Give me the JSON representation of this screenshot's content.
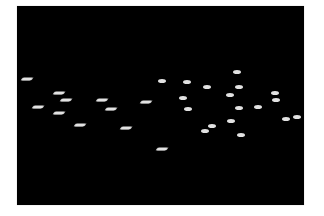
{
  "image": {
    "background_color": "#ffffff",
    "frame_color": "#000000",
    "particle_color": "#e2e2e2",
    "description": "Bright elongated particles on a black background",
    "frame": {
      "x": 17,
      "y": 6,
      "width": 287,
      "height": 199
    }
  },
  "particles": [
    {
      "x": 27,
      "y": 79,
      "shape": "streak"
    },
    {
      "x": 59,
      "y": 93,
      "shape": "streak"
    },
    {
      "x": 66,
      "y": 100,
      "shape": "streak"
    },
    {
      "x": 38,
      "y": 107,
      "shape": "streak"
    },
    {
      "x": 59,
      "y": 113,
      "shape": "streak"
    },
    {
      "x": 80,
      "y": 125,
      "shape": "streak"
    },
    {
      "x": 102,
      "y": 100,
      "shape": "streak"
    },
    {
      "x": 111,
      "y": 109,
      "shape": "streak"
    },
    {
      "x": 126,
      "y": 128,
      "shape": "streak"
    },
    {
      "x": 146,
      "y": 102,
      "shape": "streak"
    },
    {
      "x": 162,
      "y": 149,
      "shape": "streak"
    },
    {
      "x": 162,
      "y": 81,
      "shape": "dot"
    },
    {
      "x": 187,
      "y": 82,
      "shape": "dot"
    },
    {
      "x": 183,
      "y": 98,
      "shape": "dot"
    },
    {
      "x": 188,
      "y": 109,
      "shape": "dot"
    },
    {
      "x": 207,
      "y": 87,
      "shape": "dot"
    },
    {
      "x": 212,
      "y": 126,
      "shape": "dot"
    },
    {
      "x": 205,
      "y": 131,
      "shape": "dot"
    },
    {
      "x": 237,
      "y": 72,
      "shape": "dot"
    },
    {
      "x": 239,
      "y": 87,
      "shape": "dot"
    },
    {
      "x": 230,
      "y": 95,
      "shape": "dot"
    },
    {
      "x": 239,
      "y": 108,
      "shape": "dot"
    },
    {
      "x": 231,
      "y": 121,
      "shape": "dot"
    },
    {
      "x": 241,
      "y": 135,
      "shape": "dot"
    },
    {
      "x": 258,
      "y": 107,
      "shape": "dot"
    },
    {
      "x": 275,
      "y": 93,
      "shape": "dot"
    },
    {
      "x": 276,
      "y": 100,
      "shape": "dot"
    },
    {
      "x": 286,
      "y": 119,
      "shape": "dot"
    },
    {
      "x": 297,
      "y": 117,
      "shape": "dot"
    }
  ]
}
